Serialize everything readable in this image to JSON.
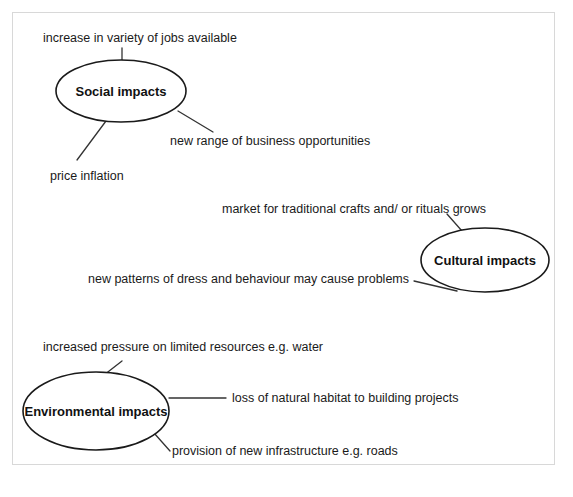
{
  "diagram": {
    "type": "mind-map",
    "frame": {
      "border_color": "#d8d8d8",
      "background": "#ffffff"
    },
    "ink_color": "#1a1a1a",
    "nodes": [
      {
        "id": "social",
        "label": "Social impacts",
        "cx": 121,
        "cy": 91,
        "rx": 65,
        "ry": 31,
        "leaves": [
          {
            "id": "social-leaf-1",
            "text": "increase in variety of jobs available",
            "text_x": 43,
            "text_y": 42,
            "anchor": "start",
            "line": {
              "x1": 122,
              "y1": 48,
              "x2": 122,
              "y2": 61
            }
          },
          {
            "id": "social-leaf-2",
            "text": "new range of business opportunities",
            "text_x": 170,
            "text_y": 145,
            "anchor": "start",
            "line": {
              "x1": 178,
              "y1": 111,
              "x2": 213,
              "y2": 132
            }
          },
          {
            "id": "social-leaf-3",
            "text": "price inflation",
            "text_x": 50,
            "text_y": 180,
            "anchor": "start",
            "line": {
              "x1": 106,
              "y1": 121,
              "x2": 77,
              "y2": 160
            }
          }
        ]
      },
      {
        "id": "cultural",
        "label": "Cultural impacts",
        "cx": 485,
        "cy": 260,
        "rx": 64,
        "ry": 32,
        "leaves": [
          {
            "id": "cultural-leaf-1",
            "text": "market for traditional crafts and/ or rituals grows",
            "text_x": 222,
            "text_y": 213,
            "anchor": "start",
            "line": {
              "x1": 447,
              "y1": 214,
              "x2": 462,
              "y2": 231
            }
          },
          {
            "id": "cultural-leaf-2",
            "text": "new patterns of dress and behaviour may cause problems",
            "text_x": 88,
            "text_y": 283,
            "anchor": "start",
            "line": {
              "x1": 414,
              "y1": 281,
              "x2": 457,
              "y2": 291
            }
          }
        ]
      },
      {
        "id": "environmental",
        "label": "Environmental impacts",
        "cx": 96,
        "cy": 411,
        "rx": 73,
        "ry": 39,
        "leaves": [
          {
            "id": "environmental-leaf-1",
            "text": "increased pressure on limited resources e.g. water",
            "text_x": 43,
            "text_y": 351,
            "anchor": "start",
            "line": {
              "x1": 104,
              "y1": 375,
              "x2": 122,
              "y2": 361
            }
          },
          {
            "id": "environmental-leaf-2",
            "text": "loss of natural habitat to building projects",
            "text_x": 232,
            "text_y": 402,
            "anchor": "start",
            "line": {
              "x1": 169,
              "y1": 398,
              "x2": 226,
              "y2": 398
            }
          },
          {
            "id": "environmental-leaf-3",
            "text": "provision of new infrastructure e.g. roads",
            "text_x": 172,
            "text_y": 455,
            "anchor": "start",
            "line": {
              "x1": 154,
              "y1": 433,
              "x2": 170,
              "y2": 451
            }
          }
        ]
      }
    ]
  }
}
